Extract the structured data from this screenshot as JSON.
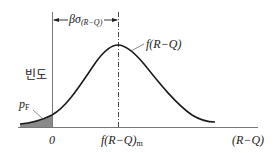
{
  "diagram": {
    "type": "probability-density-of-safety-margin",
    "curve_label": "f(R−Q)",
    "curve_label_parts": {
      "main": "f(R−Q)"
    },
    "y_axis_label": "빈도",
    "x_axis_label": "(R−Q)",
    "origin_label": "0",
    "mean_label": {
      "main": "f(R−Q)",
      "sub": "m"
    },
    "failure_prob_label": {
      "main": "p",
      "sub": "F"
    },
    "distance_label": {
      "main": "βσ",
      "sub": "(R−Q)"
    },
    "colors": {
      "line": "#1a1a1a",
      "axis": "#777777",
      "shade": "#8a8a8a"
    }
  }
}
